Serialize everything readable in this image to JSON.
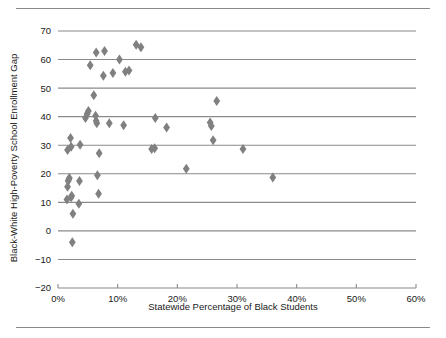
{
  "figure": {
    "top_rule": "",
    "bottom_rule": ""
  },
  "chart_data": {
    "type": "scatter",
    "title": "",
    "xlabel": "Statewide Percentage of Black Students",
    "ylabel": "Black-White High-Poverty School Enrollment Gap",
    "xlim": [
      0,
      60
    ],
    "ylim": [
      -20,
      70
    ],
    "xticks": [
      0,
      10,
      20,
      30,
      40,
      50,
      60
    ],
    "xticklabels": [
      "0%",
      "10%",
      "20%",
      "30%",
      "40%",
      "50%",
      "60%"
    ],
    "yticks": [
      -20,
      -10,
      0,
      10,
      20,
      30,
      40,
      50,
      60,
      70
    ],
    "yticklabels": [
      "−20",
      "−10",
      "0",
      "10",
      "20",
      "30",
      "40",
      "50",
      "60",
      "70"
    ],
    "grid": "horizontal",
    "grid_color": "#8a8a8a",
    "marker": "diamond",
    "marker_color": "#808080",
    "legend": "none",
    "series": [
      {
        "name": "States",
        "points": [
          [
            1.5,
            11.0
          ],
          [
            1.6,
            15.5
          ],
          [
            1.7,
            17.5
          ],
          [
            1.8,
            18.0
          ],
          [
            1.9,
            18.5
          ],
          [
            1.6,
            28.3
          ],
          [
            2.2,
            11.8
          ],
          [
            2.3,
            12.3
          ],
          [
            2.1,
            32.5
          ],
          [
            2.2,
            29.5
          ],
          [
            2.5,
            6.0
          ],
          [
            2.4,
            -4.0
          ],
          [
            3.5,
            9.5
          ],
          [
            3.6,
            17.5
          ],
          [
            3.7,
            30.2
          ],
          [
            4.6,
            39.5
          ],
          [
            4.9,
            41.0
          ],
          [
            5.1,
            42.0
          ],
          [
            6.0,
            47.5
          ],
          [
            6.3,
            40.3
          ],
          [
            6.4,
            38.5
          ],
          [
            6.5,
            37.7
          ],
          [
            6.6,
            19.5
          ],
          [
            6.8,
            13.0
          ],
          [
            6.9,
            27.2
          ],
          [
            5.4,
            58.0
          ],
          [
            6.4,
            62.5
          ],
          [
            7.8,
            63.0
          ],
          [
            7.6,
            54.3
          ],
          [
            9.2,
            55.3
          ],
          [
            10.3,
            60.0
          ],
          [
            8.6,
            37.7
          ],
          [
            11.0,
            37.0
          ],
          [
            11.3,
            55.7
          ],
          [
            11.9,
            56.2
          ],
          [
            13.1,
            65.2
          ],
          [
            13.9,
            64.3
          ],
          [
            16.3,
            39.5
          ],
          [
            15.7,
            28.7
          ],
          [
            16.2,
            28.9
          ],
          [
            18.2,
            36.2
          ],
          [
            21.5,
            21.8
          ],
          [
            25.5,
            38.0
          ],
          [
            25.7,
            36.7
          ],
          [
            26.6,
            45.5
          ],
          [
            26.0,
            31.7
          ],
          [
            31.0,
            28.7
          ],
          [
            36.0,
            18.7
          ]
        ]
      }
    ]
  }
}
